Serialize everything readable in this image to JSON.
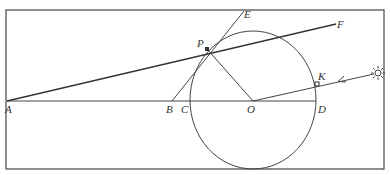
{
  "diagram": {
    "type": "geometry",
    "colors": {
      "stroke": "#333333",
      "background": "#ffffff"
    },
    "points": {
      "A": {
        "label": "A",
        "x": 7,
        "y": 101
      },
      "B": {
        "label": "B",
        "x": 172,
        "y": 101
      },
      "C": {
        "label": "C",
        "x": 190,
        "y": 101
      },
      "O": {
        "label": "O",
        "x": 253,
        "y": 101
      },
      "D": {
        "label": "D",
        "x": 316,
        "y": 101
      },
      "P": {
        "label": "P",
        "x": 207,
        "y": 49
      },
      "E": {
        "label": "E",
        "x": 243,
        "y": 12
      },
      "F": {
        "label": "F",
        "x": 335,
        "y": 24
      },
      "K": {
        "label": "K",
        "x": 317,
        "y": 84
      }
    },
    "sun_icon": "sun-icon",
    "segments": [
      "A-D",
      "A-P-F",
      "B-P-E",
      "P-O",
      "O-K-sun"
    ],
    "circle": {
      "center": "O",
      "rx": 63,
      "ry": 68
    }
  }
}
